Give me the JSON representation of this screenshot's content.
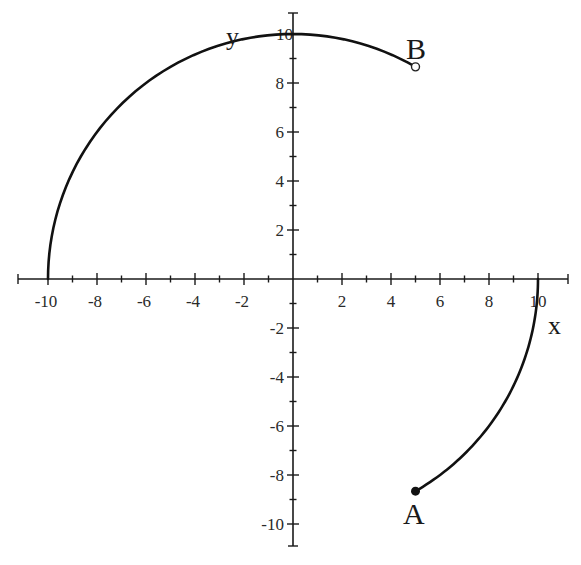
{
  "chart_data": {
    "type": "line",
    "title": "",
    "xlabel": "x",
    "ylabel": "y",
    "xlim": [
      -11,
      11
    ],
    "ylim": [
      -11,
      11
    ],
    "grid": false,
    "legend": null,
    "x_tick_labels": [
      "-10",
      "-8",
      "-6",
      "-4",
      "-2",
      "2",
      "4",
      "6",
      "8",
      "10"
    ],
    "y_tick_labels": [
      "10",
      "8",
      "6",
      "4",
      "2",
      "-2",
      "-4",
      "-6",
      "-8",
      "-10"
    ],
    "x_ticks": [
      -10,
      -8,
      -6,
      -4,
      -2,
      2,
      4,
      6,
      8,
      10
    ],
    "y_ticks": [
      10,
      8,
      6,
      4,
      2,
      -2,
      -4,
      -6,
      -8,
      -10
    ],
    "minor_tick_step": 1,
    "series": [
      {
        "name": "upper-arc",
        "description": "Arc of circle radius 10 from B (60°) counter-clockwise to (-10, 0) (180°)",
        "radius": 10,
        "start_angle_deg": 60,
        "end_angle_deg": 180,
        "points": [
          [
            5,
            8.66
          ],
          [
            2.59,
            9.66
          ],
          [
            0,
            10
          ],
          [
            -2.59,
            9.66
          ],
          [
            -5,
            8.66
          ],
          [
            -7.07,
            7.07
          ],
          [
            -8.66,
            5
          ],
          [
            -9.66,
            2.59
          ],
          [
            -10,
            0
          ]
        ]
      },
      {
        "name": "lower-arc",
        "description": "Arc of circle radius 10 from A (-60°) counter-clockwise to (10, 0) (0°)",
        "radius": 10,
        "start_angle_deg": -60,
        "end_angle_deg": 0,
        "points": [
          [
            5,
            -8.66
          ],
          [
            7.07,
            -7.07
          ],
          [
            8.66,
            -5
          ],
          [
            9.66,
            -2.59
          ],
          [
            10,
            0
          ]
        ]
      }
    ],
    "annotations": [
      {
        "label": "A",
        "x": 5,
        "y": -8.66,
        "marker": "filled-circle"
      },
      {
        "label": "B",
        "x": 5,
        "y": 8.66,
        "marker": "open-circle"
      }
    ]
  },
  "labels": {
    "x_axis": "x",
    "y_axis": "y",
    "point_a": "A",
    "point_b": "B"
  }
}
